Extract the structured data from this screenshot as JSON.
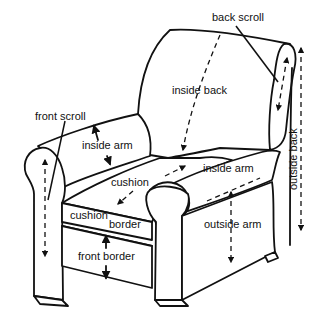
{
  "diagram": {
    "line_color": "#111111",
    "background": "#ffffff",
    "labels": {
      "back_scroll": "back scroll",
      "inside_back": "inside back",
      "front_scroll": "front scroll",
      "inside_arm_left": "inside arm",
      "cushion": "cushion",
      "inside_arm_right": "inside arm",
      "cushion_border_1": "cushion",
      "cushion_border_2": "border",
      "outside_arm": "outside arm",
      "front_border": "front border",
      "outside_back": "outside back"
    }
  }
}
